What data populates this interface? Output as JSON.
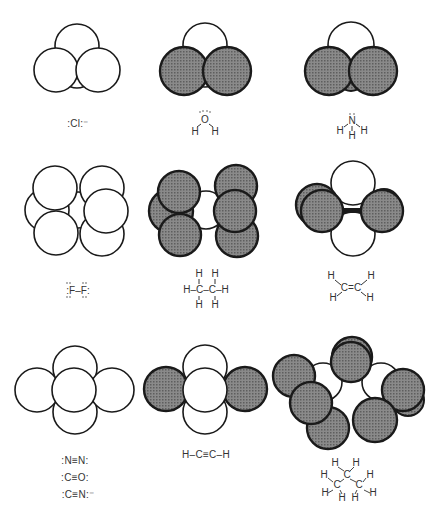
{
  "figure": {
    "colors": {
      "empty_fill": "#ffffff",
      "shaded_fill": "#7a7a7a",
      "stroke": "#1a1a1a"
    },
    "panels": [
      {
        "id": "chloride",
        "formula": ":Cl:⁻",
        "label": "Cl⁻"
      },
      {
        "id": "water",
        "formula": "H–O–H",
        "label": "H2O"
      },
      {
        "id": "ammonia",
        "formula": "NH3",
        "label": "NH3"
      },
      {
        "id": "fluorine",
        "formula": ":F–F:",
        "label": "F2"
      },
      {
        "id": "ethane",
        "formula": "H3C–CH3",
        "label": "C2H6"
      },
      {
        "id": "ethylene",
        "formula": "H2C=CH2",
        "label": "C2H4"
      },
      {
        "id": "nitrogen-group",
        "formulas": [
          ":N≡N:",
          ":C≡O:",
          ":C≡N:⁻"
        ],
        "label": "N2 / CO / CN⁻"
      },
      {
        "id": "acetylene",
        "formula": "H–C≡C–H",
        "label": "C2H2"
      },
      {
        "id": "propane",
        "formula": "C3H8",
        "label": "C3H8"
      }
    ]
  },
  "labels": {
    "chloride": ":Cl:⁻",
    "n2": ":N≡N:",
    "co": ":C≡O:",
    "cn": ":C≡N:⁻",
    "acetylene": "H–C≡C–H"
  }
}
